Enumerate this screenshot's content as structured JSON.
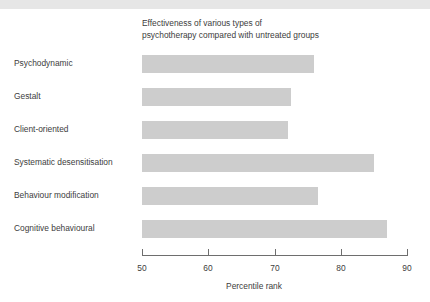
{
  "figure": {
    "title": "Effectiveness of various types of\npsychotherapy compared with untreated groups",
    "bar_color": "#cdcdcd",
    "text_color": "#3d3d3d",
    "axis_color": "#6e6e6e",
    "top_strip_color": "#e6e6e6"
  },
  "chart_data": {
    "type": "bar",
    "orientation": "horizontal",
    "title": "Effectiveness of various types of psychotherapy compared with untreated groups",
    "xlabel": "Percentile rank",
    "ylabel": "",
    "xlim": [
      50,
      90
    ],
    "xticks": [
      50,
      60,
      70,
      80,
      90
    ],
    "xtick_labels": [
      "50",
      "60",
      "70",
      "80",
      "90"
    ],
    "grid": false,
    "legend": false,
    "categories": [
      "Psychodynamic",
      "Gestalt",
      "Client-oriented",
      "Systematic desensitisation",
      "Behaviour modification",
      "Cognitive behavioural"
    ],
    "values": [
      76,
      72.5,
      72,
      85,
      76.5,
      87
    ],
    "bars": [
      {
        "label": "Psychodynamic",
        "value": 76
      },
      {
        "label": "Gestalt",
        "value": 72.5
      },
      {
        "label": "Client-oriented",
        "value": 72
      },
      {
        "label": "Systematic desensitisation",
        "value": 85
      },
      {
        "label": "Behaviour modification",
        "value": 76.5
      },
      {
        "label": "Cognitive behavioural",
        "value": 87
      }
    ]
  }
}
